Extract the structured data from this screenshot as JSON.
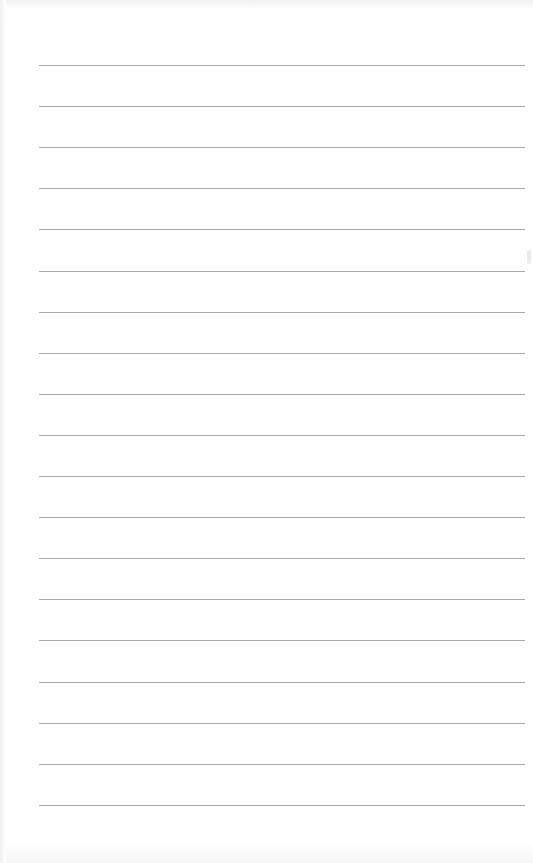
{
  "page": {
    "type": "lined-paper",
    "background_color": "#ffffff",
    "line_color": "#a9a9a9",
    "line_count": 19,
    "line_start_x": 39,
    "line_end_x": 525,
    "first_line_y": 65,
    "line_spacing": 41.1
  }
}
